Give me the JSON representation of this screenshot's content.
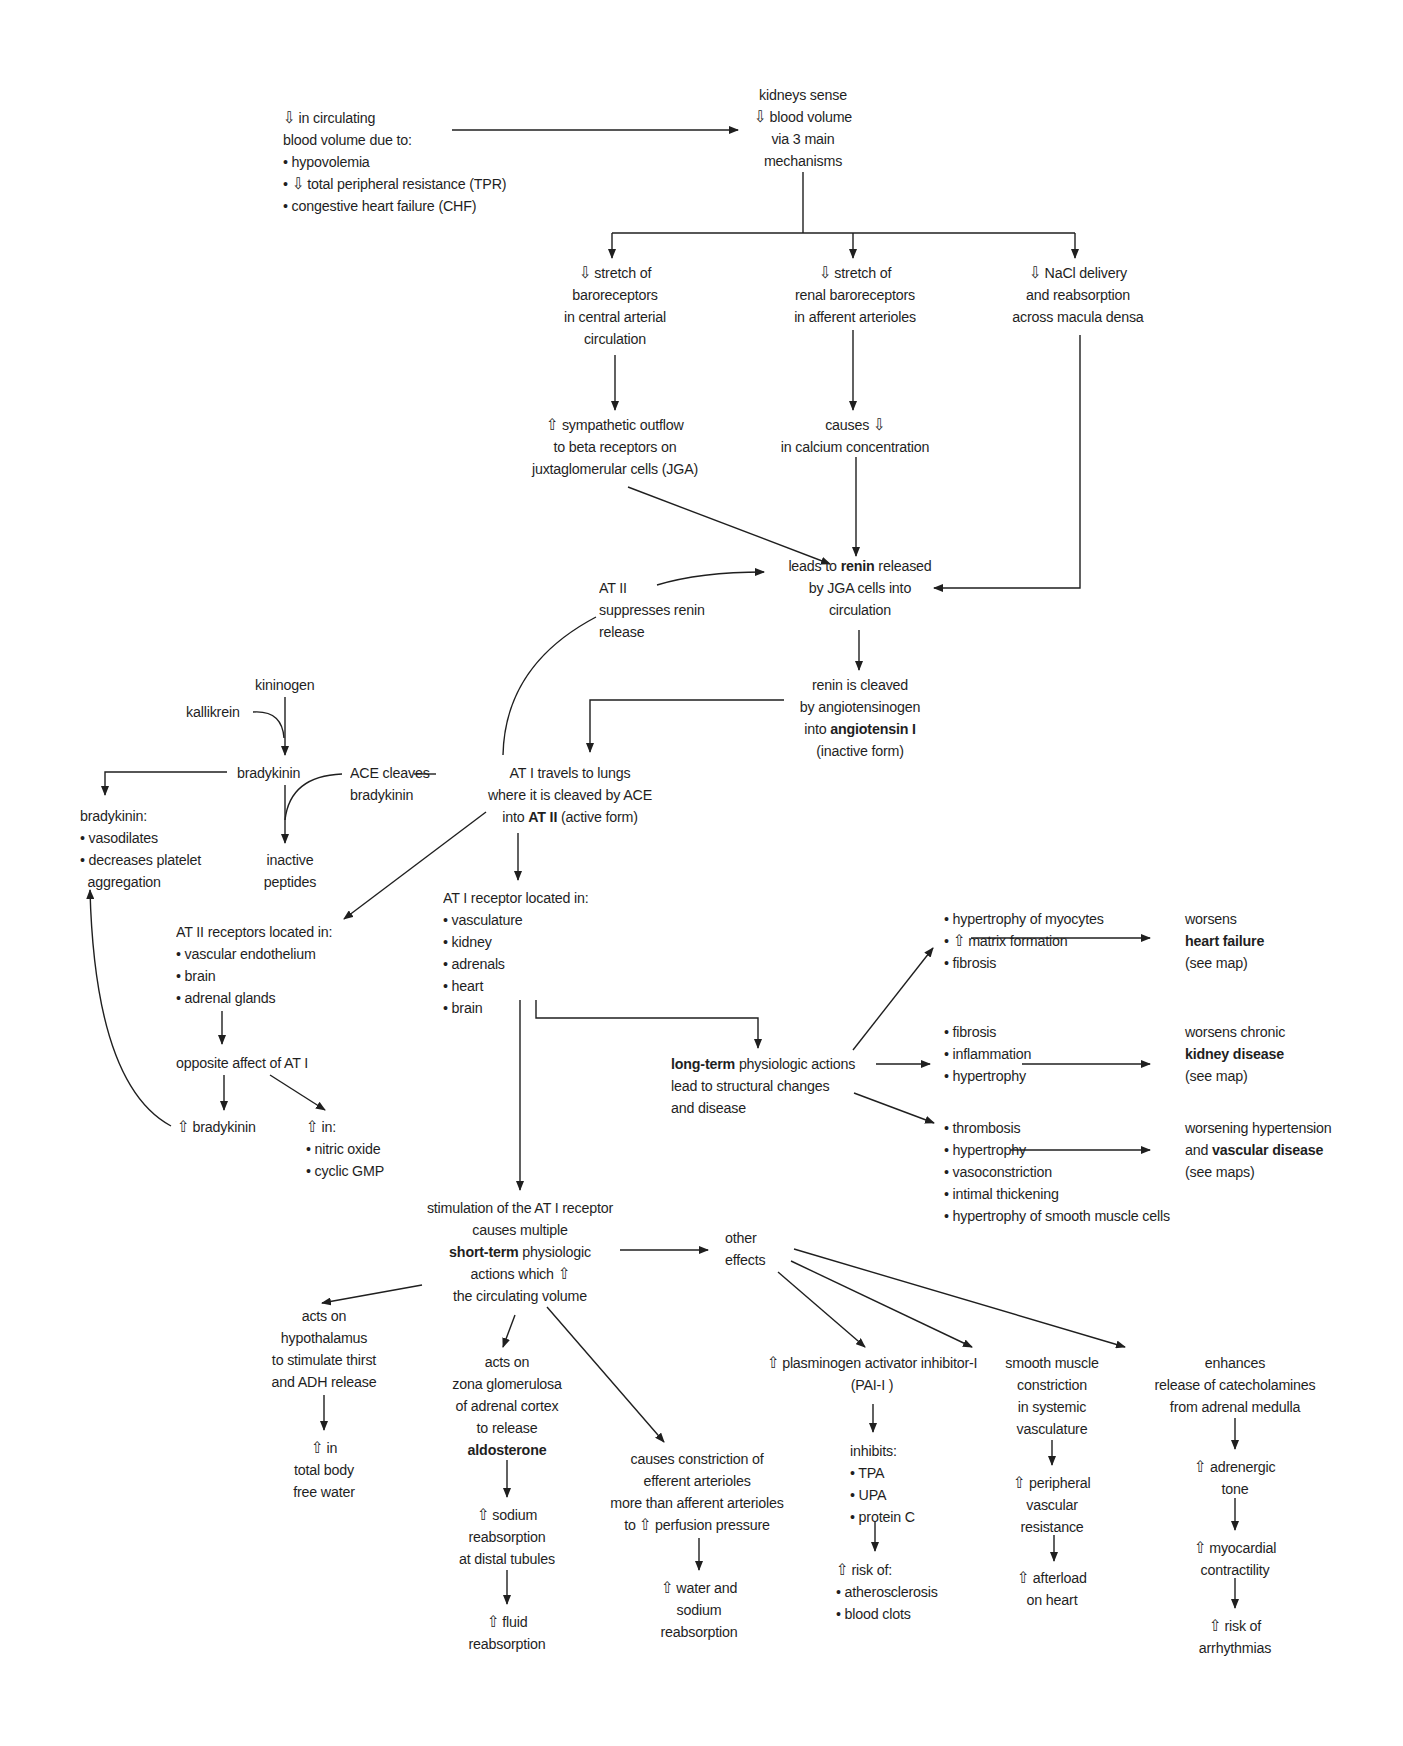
{
  "diagram": {
    "colors": {
      "background": "#ffffff",
      "text": "#1f1f1f",
      "lines": "#1f1f1f"
    },
    "symbols": {
      "decrease": "⇩",
      "increase": "⇧",
      "bullet": "•"
    },
    "nodes": {
      "cause": {
        "lines": [
          "⇩ in circulating",
          "blood volume due to:",
          "• hypovolemia",
          "• ⇩ total peripheral resistance (TPR)",
          "• congestive heart failure (CHF)"
        ]
      },
      "kidneys_sense": {
        "lines": [
          "kidneys sense",
          "⇩ blood volume",
          "via 3 main",
          "mechanisms"
        ]
      },
      "mech1": {
        "lines": [
          "⇩ stretch of",
          "baroreceptors",
          "in central arterial",
          "circulation"
        ]
      },
      "mech2": {
        "lines": [
          "⇩ stretch of",
          "renal baroreceptors",
          "in afferent arterioles"
        ]
      },
      "mech3": {
        "lines": [
          "⇩ NaCl delivery",
          "and reabsorption",
          "across macula densa"
        ]
      },
      "sympathetic": {
        "lines": [
          "⇧ sympathetic outflow",
          "to beta receptors on",
          "juxtaglomerular cells (JGA)"
        ]
      },
      "calcium": {
        "lines": [
          "causes ⇩",
          "in calcium concentration"
        ]
      },
      "renin_release": {
        "pre": "leads to ",
        "bold": "renin",
        "post": " released",
        "lines": [
          "by JGA cells into",
          "circulation"
        ]
      },
      "at2_suppress": {
        "lines": [
          "AT II",
          "suppresses renin",
          "release"
        ]
      },
      "renin_cleaved": {
        "lines": [
          "renin is cleaved",
          "by angiotensinogen"
        ],
        "pre": "into ",
        "bold": "angiotensin I",
        "last": "(inactive form)"
      },
      "at1_lungs": {
        "lines": [
          "AT I travels to lungs",
          "where it is cleaved by ACE"
        ],
        "pre": "into ",
        "bold": "AT II",
        "post": " (active form)"
      },
      "kininogen": {
        "text": "kininogen"
      },
      "kallikrein": {
        "text": "kallikrein"
      },
      "bradykinin": {
        "text": "bradykinin"
      },
      "ace_cleaves": {
        "lines": [
          "ACE cleaves",
          "bradykinin"
        ]
      },
      "inactive_peptides": {
        "lines": [
          "inactive",
          "peptides"
        ]
      },
      "bradykinin_effects": {
        "lines": [
          "bradykinin:",
          "• vasodilates",
          "• decreases platelet",
          "  aggregation"
        ]
      },
      "at2_receptors": {
        "lines": [
          "AT II receptors located in:",
          "• vascular endothelium",
          "• brain",
          "• adrenal glands"
        ]
      },
      "opposite": {
        "text": "opposite affect of AT I"
      },
      "inc_bradykinin": {
        "text": "⇧ bradykinin"
      },
      "inc_in": {
        "lines": [
          "⇧ in:",
          "• nitric oxide",
          "• cyclic GMP"
        ]
      },
      "at1_receptor": {
        "lines": [
          "AT I receptor located in:",
          "• vasculature",
          "• kidney",
          "• adrenals",
          "• heart",
          "• brain"
        ]
      },
      "long_term": {
        "bold": "long-term",
        "post": " physiologic actions",
        "lines": [
          "lead to structural changes",
          "and disease"
        ]
      },
      "lt_heart": {
        "lines": [
          "• hypertrophy of myocytes",
          "• ⇧ matrix formation",
          "• fibrosis"
        ]
      },
      "lt_kidney": {
        "lines": [
          "• fibrosis",
          "• inflammation",
          "• hypertrophy"
        ]
      },
      "lt_vascular": {
        "lines": [
          "• thrombosis",
          "• hypertrophy",
          "• vasoconstriction",
          "• intimal thickening",
          "• hypertrophy of smooth muscle cells"
        ]
      },
      "out_heart": {
        "pre_line": "worsens",
        "bold": "heart failure",
        "last": "(see map)"
      },
      "out_kidney": {
        "pre_line": "worsens chronic",
        "bold": "kidney disease",
        "last": "(see map)"
      },
      "out_vascular": {
        "pre_line": "worsening hypertension",
        "pre": "and ",
        "bold": "vascular disease",
        "last": "(see maps)"
      },
      "short_term": {
        "lines_top": [
          "stimulation of the AT I receptor",
          "causes multiple"
        ],
        "bold": "short-term",
        "post": " physiologic",
        "lines_bottom": [
          "actions which ⇧",
          "the circulating volume"
        ]
      },
      "other_effects": {
        "lines": [
          "other",
          "effects"
        ]
      },
      "hypothalamus": {
        "lines": [
          "acts on",
          "hypothalamus",
          "to stimulate thirst",
          "and ADH release"
        ]
      },
      "free_water": {
        "lines": [
          "⇧ in",
          "total body",
          "free water"
        ]
      },
      "zona": {
        "lines": [
          "acts on",
          "zona glomerulosa",
          "of adrenal cortex",
          "to release"
        ],
        "bold": "aldosterone"
      },
      "sodium_reabs": {
        "lines": [
          "⇧ sodium",
          "reabsorption",
          "at distal tubules"
        ]
      },
      "fluid_reabs": {
        "lines": [
          "⇧ fluid",
          "reabsorption"
        ]
      },
      "efferent": {
        "lines": [
          "causes constriction of",
          "efferent arterioles",
          "more than afferent arterioles",
          "to ⇧ perfusion pressure"
        ]
      },
      "water_sodium": {
        "lines": [
          "⇧ water and",
          "sodium",
          "reabsorption"
        ]
      },
      "pai1": {
        "lines": [
          "⇧ plasminogen activator inhibitor-I",
          "(PAI-I )"
        ]
      },
      "inhibits": {
        "lines": [
          "inhibits:",
          "• TPA",
          "• UPA",
          "• protein C"
        ]
      },
      "risk_of": {
        "lines": [
          "⇧ risk of:",
          "• atherosclerosis",
          "• blood clots"
        ]
      },
      "smooth_muscle": {
        "lines": [
          "smooth muscle",
          "constriction",
          "in systemic",
          "vasculature"
        ]
      },
      "pvr": {
        "lines": [
          "⇧ peripheral",
          "vascular",
          "resistance"
        ]
      },
      "afterload": {
        "lines": [
          "⇧ afterload",
          "on heart"
        ]
      },
      "catecholamines": {
        "lines": [
          "enhances",
          "release of catecholamines",
          "from adrenal medulla"
        ]
      },
      "adrenergic": {
        "lines": [
          "⇧ adrenergic",
          "tone"
        ]
      },
      "contractility": {
        "lines": [
          "⇧ myocardial",
          "contractility"
        ]
      },
      "arrhythmias": {
        "lines": [
          "⇧ risk of",
          "arrhythmias"
        ]
      }
    }
  }
}
